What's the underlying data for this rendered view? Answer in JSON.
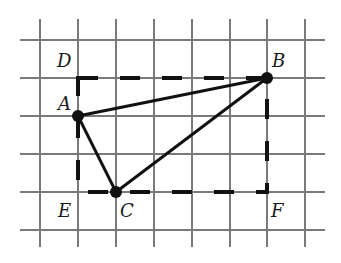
{
  "diagram": {
    "type": "geometry-on-grid",
    "grid": {
      "color": "#7a7a7a",
      "vertical_x": [
        40,
        78,
        116,
        154,
        192,
        230,
        267,
        305
      ],
      "vertical_y_range": [
        19,
        247
      ],
      "horizontal_y": [
        40,
        78,
        116,
        154,
        192,
        230
      ],
      "horizontal_x_range": [
        20,
        325
      ],
      "cell_size_px": 38
    },
    "points": {
      "D": {
        "label": "D",
        "x": 78,
        "y": 78,
        "grid": [
          1,
          1
        ],
        "marked": false
      },
      "B": {
        "label": "B",
        "x": 267,
        "y": 78,
        "grid": [
          6,
          1
        ],
        "marked": true
      },
      "A": {
        "label": "A",
        "x": 78,
        "y": 116,
        "grid": [
          1,
          2
        ],
        "marked": true
      },
      "E": {
        "label": "E",
        "x": 78,
        "y": 192,
        "grid": [
          1,
          4
        ],
        "marked": false
      },
      "C": {
        "label": "C",
        "x": 116,
        "y": 192,
        "grid": [
          2,
          4
        ],
        "marked": true
      },
      "F": {
        "label": "F",
        "x": 267,
        "y": 192,
        "grid": [
          6,
          4
        ],
        "marked": false
      }
    },
    "labels": {
      "D": "D",
      "B": "B",
      "A": "A",
      "E": "E",
      "C": "C",
      "F": "F"
    },
    "triangle": [
      "A",
      "B",
      "C"
    ],
    "dashed_rectangle": [
      "D",
      "B",
      "F",
      "E"
    ],
    "colors": {
      "line": "#111111",
      "background": "#ffffff"
    }
  }
}
